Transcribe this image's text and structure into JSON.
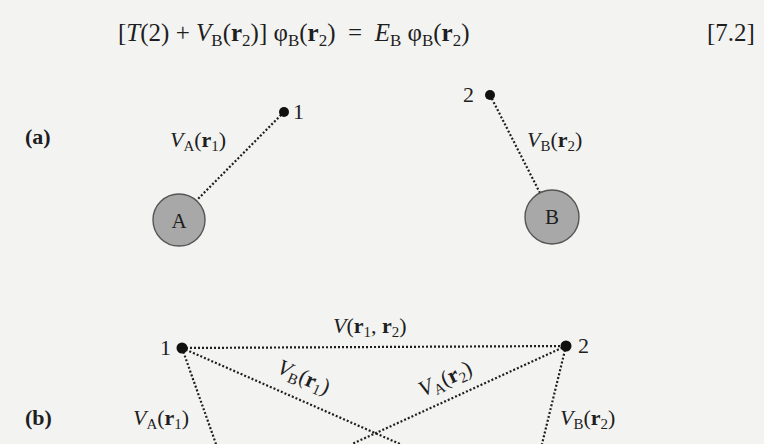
{
  "equation": {
    "parts": {
      "open_bracket": "[",
      "T": "T",
      "T_arg": "(2)",
      "plus": " + ",
      "V": "V",
      "V_sub": "B",
      "open_paren": "(",
      "r": "r",
      "r_sub": "2",
      "close": ")]",
      "phi": " φ",
      "phi_sub": "B",
      "phi_open": "(",
      "phi_r": "r",
      "phi_r_sub": "2",
      "phi_close": ")",
      "equals": "  =  ",
      "E": "E",
      "E_sub": "B",
      "phi2": " φ",
      "phi2_sub": "B",
      "phi2_open": "(",
      "phi2_r": "r",
      "phi2_r_sub": "2",
      "phi2_close": ")"
    },
    "number": "[7.2]"
  },
  "panel_a": {
    "label": "(a)",
    "electron_1": {
      "label": "1"
    },
    "electron_2": {
      "label": "2"
    },
    "nucleus_A": {
      "label": "A"
    },
    "nucleus_B": {
      "label": "B"
    },
    "potential_A_r1": {
      "V": "V",
      "sub": "A",
      "open": "(",
      "r": "r",
      "r_sub": "1",
      "close": ")"
    },
    "potential_B_r2": {
      "V": "V",
      "sub": "B",
      "open": "(",
      "r": "r",
      "r_sub": "2",
      "close": ")"
    }
  },
  "panel_b": {
    "label": "(b)",
    "electron_1": {
      "label": "1"
    },
    "electron_2": {
      "label": "2"
    },
    "interaction_r1_r2": {
      "V": "V",
      "open": "(",
      "r1": "r",
      "r1_sub": "1",
      "comma": ", ",
      "r2": "r",
      "r2_sub": "2",
      "close": ")"
    },
    "potential_A_r1": {
      "V": "V",
      "sub": "A",
      "open": "(",
      "r": "r",
      "r_sub": "1",
      "close": ")"
    },
    "potential_B_r1": {
      "V": "V",
      "sub": "B",
      "open": "(",
      "r": "r",
      "r_sub": "1",
      "close": ")"
    },
    "potential_A_r2": {
      "V": "V",
      "sub": "A",
      "open": "(",
      "r": "r",
      "r_sub": "2",
      "close": ")"
    },
    "potential_B_r2": {
      "V": "V",
      "sub": "B",
      "open": "(",
      "r": "r",
      "r_sub": "2",
      "close": ")"
    }
  },
  "colors": {
    "background": "#f3f3f1",
    "nucleus_fill": "#a8a8a8",
    "nucleus_stroke": "#555555",
    "ink": "#1e1e1e"
  }
}
